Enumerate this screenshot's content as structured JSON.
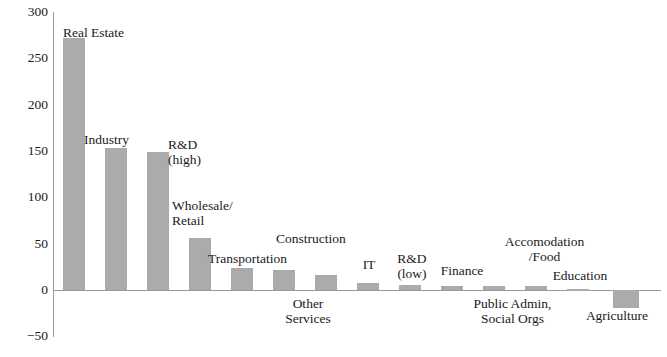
{
  "chart_data": {
    "type": "bar",
    "title": "Unit: USD Billion",
    "xlabel": "",
    "ylabel": "",
    "ylim": [
      -50,
      300
    ],
    "yticks": [
      -50,
      0,
      50,
      100,
      150,
      200,
      250,
      300
    ],
    "ytick_labels": [
      "−50",
      "0",
      "50",
      "100",
      "150",
      "200",
      "250",
      "300"
    ],
    "grid": false,
    "legend": null,
    "bar_color": "#ababab",
    "axis_color": "#9a9a9a",
    "categories": [
      "Real Estate",
      "Industry",
      "R&D\n(high)",
      "Wholesale/\nRetail",
      "Transportation",
      "Construction",
      "Other\nServices",
      "IT",
      "R&D\n(low)",
      "Finance",
      "Public Admin,\nSocial Orgs",
      "Accomodation\n/Food",
      "Education",
      "Agriculture"
    ],
    "values": [
      272,
      153,
      149,
      56,
      24,
      22,
      16,
      8,
      5,
      4,
      4,
      4,
      1,
      -19
    ]
  },
  "labels": {
    "y": [
      "300",
      "250",
      "200",
      "150",
      "100",
      "50",
      "0",
      "−50"
    ],
    "cats": [
      "Real Estate",
      "Industry",
      "R&D\n(high)",
      "Wholesale/\nRetail",
      "Transportation",
      "Construction",
      "Other\nServices",
      "IT",
      "R&D\n(low)",
      "Finance",
      "Public Admin,\nSocial Orgs",
      "Accomodation\n/Food",
      "Education",
      "Agriculture"
    ]
  }
}
